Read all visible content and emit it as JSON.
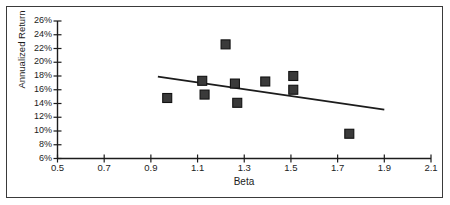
{
  "chart_data": {
    "type": "scatter",
    "title": "",
    "xlabel": "Beta",
    "ylabel": "Annualized Return",
    "xlim": [
      0.5,
      2.1
    ],
    "ylim": [
      0.06,
      0.26
    ],
    "xticks": [
      "0.5",
      "0.7",
      "0.9",
      "1.1",
      "1.3",
      "1.5",
      "1.7",
      "1.9",
      "2.1"
    ],
    "xtick_values": [
      0.5,
      0.7,
      0.9,
      1.1,
      1.3,
      1.5,
      1.7,
      1.9,
      2.1
    ],
    "yticks": [
      "6%",
      "8%",
      "10%",
      "12%",
      "14%",
      "16%",
      "18%",
      "20%",
      "22%",
      "24%",
      "26%"
    ],
    "ytick_values": [
      6,
      8,
      10,
      12,
      14,
      16,
      18,
      20,
      22,
      24,
      26
    ],
    "grid": false,
    "legend": false,
    "marker": "square",
    "marker_color": "#3a3a3a",
    "line_color": "#1c1c1c",
    "points": [
      {
        "x": 0.97,
        "y": 14.8
      },
      {
        "x": 1.12,
        "y": 17.3
      },
      {
        "x": 1.13,
        "y": 15.3
      },
      {
        "x": 1.22,
        "y": 22.6
      },
      {
        "x": 1.26,
        "y": 16.9
      },
      {
        "x": 1.27,
        "y": 14.1
      },
      {
        "x": 1.39,
        "y": 17.2
      },
      {
        "x": 1.51,
        "y": 18.0
      },
      {
        "x": 1.51,
        "y": 16.0
      },
      {
        "x": 1.75,
        "y": 9.6
      }
    ],
    "trendline": {
      "x_start": 0.93,
      "y_start": 17.9,
      "x_end": 1.9,
      "y_end": 13.1
    }
  }
}
